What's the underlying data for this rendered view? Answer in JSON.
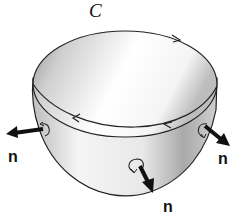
{
  "diagram": {
    "curve_label": "C",
    "normal_label": "n",
    "normals": [
      {
        "id": "left",
        "label": "n"
      },
      {
        "id": "right",
        "label": "n"
      },
      {
        "id": "bottom",
        "label": "n"
      }
    ],
    "colors": {
      "outline": "#222222",
      "surface_light": "#f4f4f4",
      "surface_shadow": "#9a9a9a",
      "arrow": "#111111"
    }
  }
}
